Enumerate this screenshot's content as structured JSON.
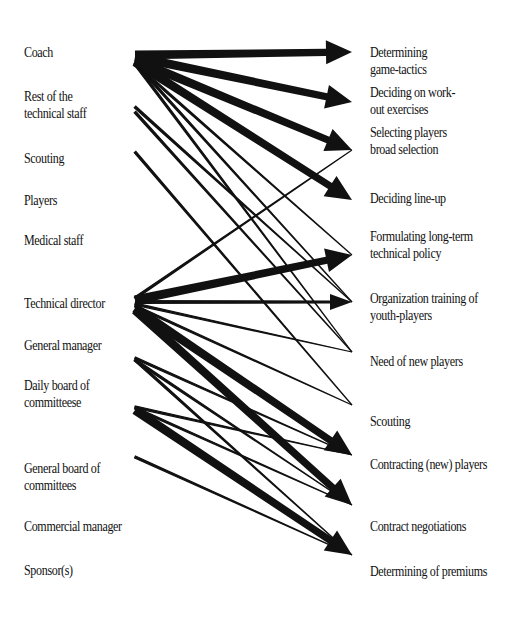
{
  "diagram": {
    "type": "bipartite-influence-diagram",
    "actors": [
      {
        "id": "coach",
        "line1": "Coach",
        "line2": "",
        "y": 44
      },
      {
        "id": "rest_technical_staff",
        "line1": "Rest of the",
        "line2": "technical staff",
        "y": 88
      },
      {
        "id": "scouting",
        "line1": "Scouting",
        "line2": "",
        "y": 150
      },
      {
        "id": "players",
        "line1": "Players",
        "line2": "",
        "y": 192
      },
      {
        "id": "medical_staff",
        "line1": "Medical staff",
        "line2": "",
        "y": 232
      },
      {
        "id": "technical_director",
        "line1": "Technical director",
        "line2": "",
        "y": 295
      },
      {
        "id": "general_manager",
        "line1": "General manager",
        "line2": "",
        "y": 337
      },
      {
        "id": "daily_board",
        "line1": "Daily board of",
        "line2": "committeese",
        "y": 377
      },
      {
        "id": "general_board",
        "line1": "General board of",
        "line2": "committees",
        "y": 460
      },
      {
        "id": "commercial_manager",
        "line1": "Commercial manager",
        "line2": "",
        "y": 518
      },
      {
        "id": "sponsors",
        "line1": "Sponsor(s)",
        "line2": "",
        "y": 562
      }
    ],
    "decisions": [
      {
        "id": "game_tactics",
        "line1": "Determining",
        "line2": "game-tactics",
        "y": 44,
        "tip_y": 52
      },
      {
        "id": "workout",
        "line1": "Deciding on work-",
        "line2": "out exercises",
        "y": 84,
        "tip_y": 102
      },
      {
        "id": "selecting",
        "line1": "Selecting players",
        "line2": "broad selection",
        "y": 124,
        "tip_y": 150
      },
      {
        "id": "lineup",
        "line1": "Deciding line-up",
        "line2": "",
        "y": 190,
        "tip_y": 200
      },
      {
        "id": "long_term_policy",
        "line1": "Formulating long-term",
        "line2": "technical policy",
        "y": 228,
        "tip_y": 255
      },
      {
        "id": "youth_training",
        "line1": "Organization training of",
        "line2": "youth-players",
        "y": 290,
        "tip_y": 302
      },
      {
        "id": "new_players",
        "line1": "Need of new players",
        "line2": "",
        "y": 353,
        "tip_y": 352
      },
      {
        "id": "scouting_task",
        "line1": "Scouting",
        "line2": "",
        "y": 413,
        "tip_y": 405
      },
      {
        "id": "contracting",
        "line1": "Contracting (new) players",
        "line2": "",
        "y": 456,
        "tip_y": 455
      },
      {
        "id": "contract_negotiations",
        "line1": "Contract negotiations",
        "line2": "",
        "y": 518,
        "tip_y": 505
      },
      {
        "id": "premiums",
        "line1": "Determining of premiums",
        "line2": "",
        "y": 563,
        "tip_y": 555
      }
    ],
    "edges": [
      {
        "from": "coach",
        "to": "game_tactics",
        "weight": "heavy",
        "y1": 55,
        "y2": 52
      },
      {
        "from": "coach",
        "to": "workout",
        "weight": "heavy",
        "y1": 57,
        "y2": 102
      },
      {
        "from": "coach",
        "to": "selecting",
        "weight": "heavy",
        "y1": 60,
        "y2": 150
      },
      {
        "from": "coach",
        "to": "lineup",
        "weight": "heavy",
        "y1": 62,
        "y2": 200
      },
      {
        "from": "coach",
        "to": "youth_training",
        "weight": "thin",
        "y1": 63,
        "y2": 302
      },
      {
        "from": "coach",
        "to": "new_players",
        "weight": "thin",
        "y1": 64,
        "y2": 352
      },
      {
        "from": "coach",
        "to": "long_term_policy",
        "weight": "thin",
        "y1": 64,
        "y2": 255
      },
      {
        "from": "rest_technical_staff",
        "to": "youth_training",
        "weight": "thin",
        "y1": 107,
        "y2": 302
      },
      {
        "from": "rest_technical_staff",
        "to": "new_players",
        "weight": "thin",
        "y1": 112,
        "y2": 352
      },
      {
        "from": "scouting",
        "to": "scouting_task",
        "weight": "thin",
        "y1": 152,
        "y2": 405
      },
      {
        "from": "technical_director",
        "to": "selecting",
        "weight": "thin",
        "y1": 298,
        "y2": 150
      },
      {
        "from": "technical_director",
        "to": "long_term_policy",
        "weight": "heavy",
        "y1": 300,
        "y2": 255
      },
      {
        "from": "technical_director",
        "to": "youth_training",
        "weight": "medium",
        "y1": 302,
        "y2": 302
      },
      {
        "from": "technical_director",
        "to": "new_players",
        "weight": "thin",
        "y1": 304,
        "y2": 352
      },
      {
        "from": "technical_director",
        "to": "scouting_task",
        "weight": "thin",
        "y1": 306,
        "y2": 405
      },
      {
        "from": "technical_director",
        "to": "contracting",
        "weight": "heavy",
        "y1": 308,
        "y2": 455
      },
      {
        "from": "technical_director",
        "to": "contract_negotiations",
        "weight": "heavy",
        "y1": 310,
        "y2": 505
      },
      {
        "from": "general_manager",
        "to": "contracting",
        "weight": "thin",
        "y1": 358,
        "y2": 455
      },
      {
        "from": "general_manager",
        "to": "contract_negotiations",
        "weight": "thin",
        "y1": 360,
        "y2": 505
      },
      {
        "from": "general_manager",
        "to": "premiums",
        "weight": "thin",
        "y1": 360,
        "y2": 555
      },
      {
        "from": "daily_board",
        "to": "contracting",
        "weight": "thin",
        "y1": 407,
        "y2": 455
      },
      {
        "from": "daily_board",
        "to": "contract_negotiations",
        "weight": "thin",
        "y1": 408,
        "y2": 505
      },
      {
        "from": "daily_board",
        "to": "premiums",
        "weight": "heavy",
        "y1": 410,
        "y2": 555
      },
      {
        "from": "general_board",
        "to": "premiums",
        "weight": "thin",
        "y1": 457,
        "y2": 555
      }
    ],
    "colors": {
      "ink": "#111111",
      "background": "#ffffff"
    }
  }
}
